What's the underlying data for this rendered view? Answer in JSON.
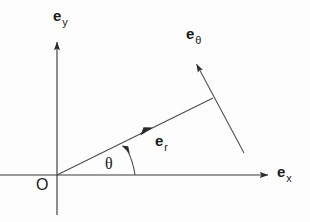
{
  "figure": {
    "background_color": "#fdfdfd",
    "line_color": "#3a3a3a",
    "text_color": "#1a1a1a"
  },
  "labels": {
    "y_axis": {
      "base": "e",
      "sub": "y",
      "name": "unit vector e sub y"
    },
    "x_axis": {
      "base": "e",
      "sub": "x",
      "name": "unit vector e sub x"
    },
    "e_theta": {
      "base": "e",
      "sub": "θ",
      "name": "unit vector e sub theta"
    },
    "e_r": {
      "base": "e",
      "sub": "r",
      "name": "unit vector e sub r"
    },
    "angle": "θ",
    "origin": "O"
  },
  "geometry": {
    "origin": {
      "x": 57,
      "y": 175
    },
    "x_axis": {
      "x1": 0,
      "y1": 175,
      "x2": 272,
      "y2": 175,
      "arrow": "right"
    },
    "y_axis": {
      "x1": 57,
      "y1": 215,
      "x2": 57,
      "y2": 38,
      "arrow": "up"
    },
    "e_r_line": {
      "x1": 57,
      "y1": 175,
      "x2": 213,
      "y2": 98,
      "arrow_at": {
        "x": 150,
        "y": 129
      }
    },
    "e_theta_line": {
      "x1": 244,
      "y1": 153,
      "x2": 194,
      "y2": 60,
      "arrow": "up-left"
    },
    "angle_arc": {
      "radius": 78,
      "start_deg": 0,
      "end_deg": 26,
      "arrow": "ccw"
    },
    "theta_value_deg": 26
  }
}
